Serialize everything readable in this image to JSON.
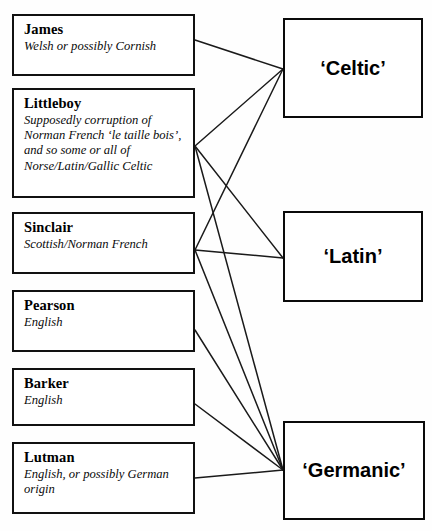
{
  "diagram": {
    "type": "relationship-map",
    "name_boxes": [
      {
        "id": "james",
        "title": "James",
        "description": "Welsh or possibly Cornish",
        "x": 12,
        "y": 14,
        "w": 183,
        "h": 62,
        "anchor_x": 195,
        "anchor_y": 40
      },
      {
        "id": "littleboy",
        "title": "Littleboy",
        "description": "Supposedly corruption of Norman French ‘le taille bois’, and so some or all of Norse/Latin/Gallic Celtic",
        "x": 12,
        "y": 88,
        "w": 183,
        "h": 110,
        "anchor_x": 195,
        "anchor_y": 146
      },
      {
        "id": "sinclair",
        "title": "Sinclair",
        "description": "Scottish/Norman French",
        "x": 12,
        "y": 212,
        "w": 183,
        "h": 62,
        "anchor_x": 195,
        "anchor_y": 250
      },
      {
        "id": "pearson",
        "title": "Pearson",
        "description": "English",
        "x": 12,
        "y": 290,
        "w": 183,
        "h": 62,
        "anchor_x": 195,
        "anchor_y": 330
      },
      {
        "id": "barker",
        "title": "Barker",
        "description": "English",
        "x": 12,
        "y": 368,
        "w": 183,
        "h": 58,
        "anchor_x": 195,
        "anchor_y": 404
      },
      {
        "id": "lutman",
        "title": "Lutman",
        "description": "English, or possibly German origin",
        "x": 12,
        "y": 442,
        "w": 183,
        "h": 72,
        "anchor_x": 195,
        "anchor_y": 478
      }
    ],
    "category_boxes": [
      {
        "id": "celtic",
        "label": "‘Celtic’",
        "x": 283,
        "y": 18,
        "w": 140,
        "h": 100,
        "anchor_x": 283,
        "anchor_y": 69
      },
      {
        "id": "latin",
        "label": "‘Latin’",
        "x": 283,
        "y": 211,
        "w": 140,
        "h": 91,
        "anchor_x": 283,
        "anchor_y": 258
      },
      {
        "id": "germanic",
        "label": "‘Germanic’",
        "x": 283,
        "y": 421,
        "w": 142,
        "h": 99,
        "anchor_x": 283,
        "anchor_y": 470
      }
    ],
    "connections": [
      {
        "from": "james",
        "to": "celtic"
      },
      {
        "from": "littleboy",
        "to": "celtic"
      },
      {
        "from": "littleboy",
        "to": "latin"
      },
      {
        "from": "littleboy",
        "to": "germanic"
      },
      {
        "from": "sinclair",
        "to": "celtic"
      },
      {
        "from": "sinclair",
        "to": "latin"
      },
      {
        "from": "sinclair",
        "to": "germanic"
      },
      {
        "from": "pearson",
        "to": "germanic"
      },
      {
        "from": "barker",
        "to": "germanic"
      },
      {
        "from": "lutman",
        "to": "germanic"
      }
    ],
    "colors": {
      "line": "#1a1a1a",
      "box_border": "#111111",
      "category_border": "#0a0a0a",
      "background": "#fefefe",
      "text": "#000000"
    }
  }
}
